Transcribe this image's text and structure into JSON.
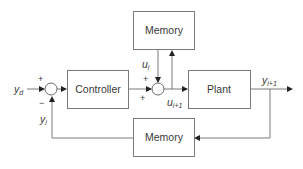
{
  "diagram": {
    "type": "block-diagram",
    "blocks": {
      "controller": "Controller",
      "plant": "Plant",
      "memory_top": "Memory",
      "memory_bottom": "Memory"
    },
    "signals": {
      "yd": {
        "base": "y",
        "sub": "d"
      },
      "yi": {
        "base": "y",
        "sub": "i"
      },
      "ui": {
        "base": "u",
        "sub": "i"
      },
      "ui1": {
        "base": "u",
        "sub": "i+1"
      },
      "yi1": {
        "base": "y",
        "sub": "i+1"
      }
    },
    "summing_junctions": {
      "error": {
        "top_sign": "+",
        "bottom_sign": "−"
      },
      "update": {
        "top_sign": "+",
        "left_sign": "+"
      }
    },
    "colors": {
      "stroke": "#7a7a7a",
      "text": "#3a3a3a",
      "arrowhead": "#222222"
    }
  }
}
